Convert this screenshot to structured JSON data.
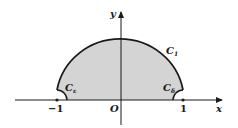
{
  "diagram": {
    "colors": {
      "fill": "#d4d4d4",
      "stroke": "#1a1a1a",
      "axis": "#1a1a1a",
      "background": "#ffffff"
    },
    "axes": {
      "x_label": "x",
      "y_label": "y",
      "origin_label": "O"
    },
    "ticks": [
      {
        "label": "−1",
        "value": -1
      },
      {
        "label": "1",
        "value": 1
      }
    ],
    "curves": [
      {
        "name": "C_1",
        "label_main": "C",
        "label_sub": "1",
        "description": "large arc"
      },
      {
        "name": "C_epsilon",
        "label_main": "C",
        "label_sub": "ε",
        "description": "small indentation arc around -1"
      },
      {
        "name": "C_delta",
        "label_main": "C",
        "label_sub": "δ",
        "description": "small indentation arc around 1"
      }
    ]
  }
}
